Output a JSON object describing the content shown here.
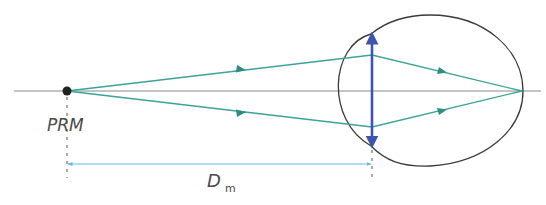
{
  "diagram": {
    "type": "optics-ray-diagram",
    "labels": {
      "point": "PRM",
      "distance_main": "D",
      "distance_sub": "m"
    },
    "colors": {
      "axis": "#8a8a8a",
      "rays": "#3aa39a",
      "ray_arrows": "#2e8c83",
      "lens": "#3d55b0",
      "eye_outline": "#3a3a3a",
      "dimension_line": "#5bc0de",
      "point": "#222222",
      "dashed_guides": "#555555",
      "text": "#4a4a4a"
    },
    "elements": [
      {
        "name": "optical-axis",
        "from": [
          14,
          91
        ],
        "to": [
          541,
          91
        ]
      },
      {
        "name": "object-point",
        "at": [
          67,
          91
        ]
      },
      {
        "name": "lens",
        "x": 372,
        "top": 34,
        "bottom": 146
      },
      {
        "name": "focus-point",
        "at": [
          522,
          91
        ]
      },
      {
        "name": "ray-upper",
        "points": [
          [
            67,
            91
          ],
          [
            372,
            55
          ],
          [
            522,
            91
          ]
        ]
      },
      {
        "name": "ray-lower",
        "points": [
          [
            67,
            91
          ],
          [
            372,
            127
          ],
          [
            522,
            91
          ]
        ]
      },
      {
        "name": "dimension",
        "from": [
          67,
          164
        ],
        "to": [
          372,
          164
        ]
      }
    ]
  }
}
